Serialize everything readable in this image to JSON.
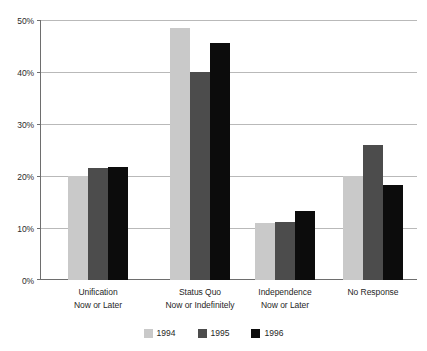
{
  "chart_data": {
    "type": "bar",
    "title": "",
    "subtitle": "",
    "xlabel": "",
    "ylabel": "",
    "grid": true,
    "legend_position": "bottom-center",
    "ylim": [
      0,
      50
    ],
    "ytick_labels": [
      "0%",
      "10%",
      "20%",
      "30%",
      "40%",
      "50%"
    ],
    "ytick_values": [
      0,
      10,
      20,
      30,
      40,
      50
    ],
    "categories": [
      "Unification Now or Later",
      "Status Quo Now or Indefinitely",
      "Independence Now or Later",
      "No Response"
    ],
    "category_lines": [
      [
        "Unification",
        "Now or Later"
      ],
      [
        "Status Quo",
        "Now or Indefinitely"
      ],
      [
        "Independence",
        "Now or Later"
      ],
      [
        "No Response",
        ""
      ]
    ],
    "series": [
      {
        "name": "1994",
        "color": "#c9c9c9",
        "values": [
          20.0,
          48.5,
          11.0,
          20.0
        ]
      },
      {
        "name": "1995",
        "color": "#4c4c4c",
        "values": [
          21.6,
          40.0,
          11.2,
          26.0
        ]
      },
      {
        "name": "1996",
        "color": "#0c0c0c",
        "values": [
          21.8,
          45.6,
          13.3,
          18.2
        ]
      }
    ]
  },
  "legend": {
    "items": [
      {
        "label": "1994",
        "swatch": "#c9c9c9"
      },
      {
        "label": "1995",
        "swatch": "#4c4c4c"
      },
      {
        "label": "1996",
        "swatch": "#0c0c0c"
      }
    ]
  },
  "colors": {
    "background": "#ffffff",
    "axis": "#6e6e6e",
    "gridline": "#b9b9b9",
    "text": "#1f1f1f"
  }
}
